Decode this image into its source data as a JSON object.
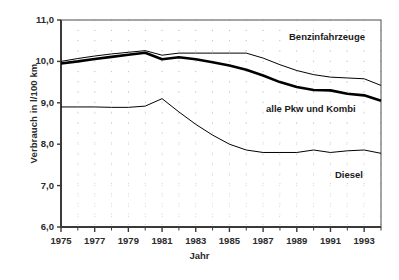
{
  "chart_data": {
    "type": "line",
    "title": "",
    "xlabel": "Jahr",
    "ylabel": "Verbrauch in l/100 km",
    "xlim": [
      1975,
      1994
    ],
    "ylim": [
      6.0,
      11.0
    ],
    "ytick_step": 1.0,
    "grid": true,
    "grid_style": "dotted",
    "legend": "inline-annotations",
    "x": [
      1975,
      1976,
      1977,
      1978,
      1979,
      1980,
      1981,
      1982,
      1983,
      1984,
      1985,
      1986,
      1987,
      1988,
      1989,
      1990,
      1991,
      1992,
      1993,
      1994
    ],
    "yticks": [
      "6,0",
      "7,0",
      "8,0",
      "9,0",
      "10,0",
      "11,0"
    ],
    "ytick_values": [
      6.0,
      7.0,
      8.0,
      9.0,
      10.0,
      11.0
    ],
    "xticks": [
      "1975",
      "1977",
      "1979",
      "1981",
      "1983",
      "1985",
      "1987",
      "1989",
      "1991",
      "1993"
    ],
    "xtick_values": [
      1975,
      1977,
      1979,
      1981,
      1983,
      1985,
      1987,
      1989,
      1991,
      1993
    ],
    "xtick_minor_values": [
      1976,
      1978,
      1980,
      1982,
      1984,
      1986,
      1988,
      1990,
      1992,
      1994
    ],
    "series": [
      {
        "name": "Benzinfahrzeuge",
        "label": "Benzinfahrzeuge",
        "color": "#000000",
        "linewidth": 1,
        "values": [
          10.0,
          10.07,
          10.13,
          10.18,
          10.22,
          10.26,
          10.15,
          10.2,
          10.2,
          10.2,
          10.2,
          10.2,
          10.08,
          9.92,
          9.78,
          9.68,
          9.62,
          9.6,
          9.58,
          9.42
        ]
      },
      {
        "name": "alle Pkw und Kombi",
        "label": "alle Pkw und Kombi",
        "color": "#000000",
        "linewidth": 2.6,
        "values": [
          9.95,
          10.0,
          10.06,
          10.11,
          10.16,
          10.21,
          10.05,
          10.1,
          10.05,
          9.98,
          9.9,
          9.8,
          9.66,
          9.5,
          9.38,
          9.31,
          9.3,
          9.22,
          9.18,
          9.05
        ]
      },
      {
        "name": "Diesel",
        "label": "Diesel",
        "color": "#000000",
        "linewidth": 1,
        "values": [
          8.9,
          8.9,
          8.9,
          8.89,
          8.89,
          8.92,
          9.1,
          8.78,
          8.48,
          8.22,
          8.0,
          7.86,
          7.8,
          7.8,
          7.8,
          7.86,
          7.8,
          7.84,
          7.86,
          7.78
        ]
      }
    ],
    "annotations": [
      {
        "name": "benzinfahrzeuge-label",
        "text": "Benzinfahrzeuge",
        "x_px": 289,
        "y_px": 31
      },
      {
        "name": "alle-pkw-label",
        "text": "alle Pkw und Kombi",
        "x_px": 266,
        "y_px": 103
      },
      {
        "name": "diesel-label",
        "text": "Diesel",
        "x_px": 335,
        "y_px": 169
      }
    ]
  },
  "axes": {
    "y_title": "Verbrauch in l/100 km",
    "x_title": "Jahr"
  }
}
